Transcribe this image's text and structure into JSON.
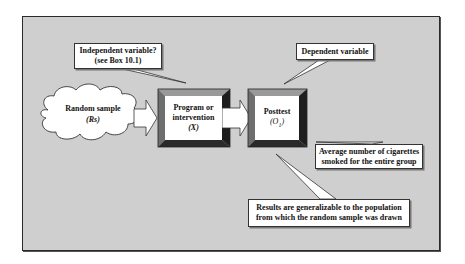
{
  "diagram": {
    "type": "single-group posttest-only research design",
    "nodes": {
      "random_sample": {
        "label": "Random sample",
        "symbol": "(Rs)",
        "shape": "cloud"
      },
      "program": {
        "label_line1": "Program or",
        "label_line2": "intervention",
        "symbol": "(X)",
        "shape": "beveled-box"
      },
      "posttest": {
        "label": "Posttest",
        "symbol": "(O1)",
        "symbol_base": "O",
        "symbol_sub": "1",
        "shape": "beveled-box"
      }
    },
    "callouts": {
      "independent": {
        "line1": "Independent variable?",
        "line2": "(see Box 10.1)",
        "points_to": "program"
      },
      "dependent": {
        "line1": "Dependent variable",
        "points_to": "posttest"
      },
      "average": {
        "line1": "Average number of cigarettes",
        "line2": "smoked for the entire group",
        "points_to": "posttest"
      },
      "results": {
        "line1": "Results are generalizable to the population",
        "line2": "from which the random sample was drawn",
        "points_to": "posttest"
      }
    },
    "edges": [
      {
        "from": "random_sample",
        "to": "program",
        "style": "block-arrow"
      },
      {
        "from": "program",
        "to": "posttest",
        "style": "block-arrow"
      }
    ],
    "colors": {
      "background": "#cfcfcf",
      "box_fill": "#ffffff",
      "bevel_top": "#9a9a9a",
      "bevel_left": "#6e6e6e",
      "bevel_right": "#1e1e1e",
      "bevel_bottom": "#2a2a2a"
    }
  }
}
